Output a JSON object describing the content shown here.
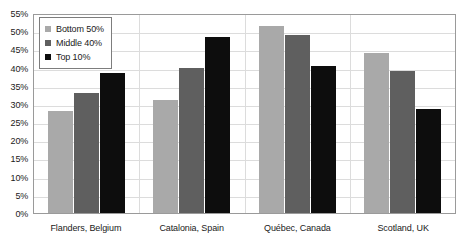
{
  "chart_data": {
    "type": "bar",
    "title": "",
    "subtitle": "",
    "xlabel": "",
    "ylabel": "",
    "categories": [
      "Flanders, Belgium",
      "Catalonia, Spain",
      "Québec, Canada",
      "Scotland, UK"
    ],
    "series": [
      {
        "name": "Bottom 50%",
        "color": "#a9a9a9",
        "values": [
          28,
          31,
          51.5,
          44
        ]
      },
      {
        "name": "Middle 40%",
        "color": "#5f5f5f",
        "values": [
          33,
          40,
          49,
          39
        ]
      },
      {
        "name": "Top 10%",
        "color": "#0d0d0d",
        "values": [
          38.5,
          48.5,
          40.5,
          28.5
        ]
      }
    ],
    "ylim": [
      0,
      55
    ],
    "ytick_step": 5,
    "ytick_labels": [
      "55%",
      "50%",
      "45%",
      "40%",
      "35%",
      "30%",
      "25%",
      "20%",
      "15%",
      "10%",
      "5%",
      "0%"
    ],
    "ytick_values": [
      55,
      50,
      45,
      40,
      35,
      30,
      25,
      20,
      15,
      10,
      5,
      0
    ],
    "grid": true,
    "grid_axis": "both",
    "legend_position": "top-left",
    "value_suffix": "%"
  }
}
